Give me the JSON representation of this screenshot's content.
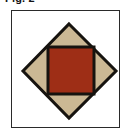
{
  "figure": {
    "label": "Fig. 2",
    "frame": {
      "background_color": "#ffffff",
      "border_color": "#2a2a2a",
      "border_width_px": 1
    },
    "shapes": [
      {
        "name": "outer-diamond",
        "type": "rotated-square",
        "fill_color": "#cbb894",
        "stroke_color": "#16130f",
        "stroke_width_px": 3,
        "points": "57,13 104,60 57,107 11,60",
        "vertices": {
          "top": [
            57,
            13
          ],
          "right": [
            104,
            60
          ],
          "bottom": [
            57,
            107
          ],
          "left": [
            11,
            60
          ]
        }
      },
      {
        "name": "inner-square",
        "type": "square",
        "fill_color": "#9e2e16",
        "stroke_color": "#16130f",
        "stroke_width_px": 3,
        "x": 36,
        "y": 36,
        "width": 46,
        "height": 47
      }
    ]
  }
}
